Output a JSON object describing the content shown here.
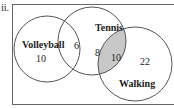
{
  "problem_label": "ii.",
  "diagram": {
    "type": "venn",
    "sets": [
      {
        "name": "Volleyball",
        "only_count": "10"
      },
      {
        "name": "Tennis",
        "only_count": "8"
      },
      {
        "name": "Walking",
        "only_count": "22"
      }
    ],
    "intersections": {
      "volleyball_tennis": "6",
      "tennis_walking": "10"
    },
    "shaded_region": "Tennis ∩ Walking",
    "colors": {
      "stroke": "#555555",
      "shade": "#c8c8c8",
      "frame": "#666666"
    }
  }
}
